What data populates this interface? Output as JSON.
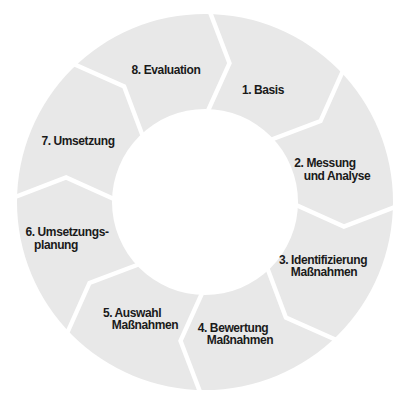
{
  "diagram": {
    "type": "cycle",
    "direction": "clockwise",
    "segment_count": 8,
    "segments": [
      {
        "id": 1,
        "label": "1. Basis",
        "lines": [
          "1. Basis"
        ]
      },
      {
        "id": 2,
        "label": "2. Messung und Analyse",
        "lines": [
          "2. Messung",
          "und Analyse"
        ]
      },
      {
        "id": 3,
        "label": "3. Identifizierung Maßnahmen",
        "lines": [
          "3. Identifizierung",
          "Maßnahmen"
        ]
      },
      {
        "id": 4,
        "label": "4. Bewertung Maßnahmen",
        "lines": [
          "4. Bewertung",
          "Maßnahmen"
        ]
      },
      {
        "id": 5,
        "label": "5. Auswahl Maßnahmen",
        "lines": [
          "5. Auswahl",
          "Maßnahmen"
        ]
      },
      {
        "id": 6,
        "label": "6. Umsetzungsplanung",
        "lines": [
          "6. Umsetzungs-",
          "planung"
        ]
      },
      {
        "id": 7,
        "label": "7. Umsetzung",
        "lines": [
          "7. Umsetzung"
        ]
      },
      {
        "id": 8,
        "label": "8. Evaluation",
        "lines": [
          "8. Evaluation"
        ]
      }
    ],
    "colors": {
      "segment_fill": "#e8e8e8",
      "gap": "#ffffff",
      "text": "#1a1a1a",
      "background": "#ffffff"
    }
  }
}
